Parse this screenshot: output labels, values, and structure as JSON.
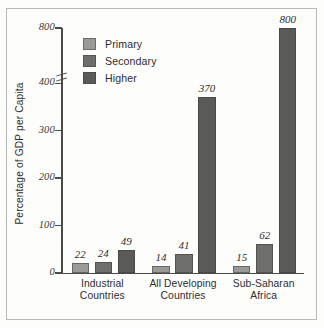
{
  "chart_data": {
    "type": "bar",
    "title": "",
    "subtitle": "",
    "xlabel": "",
    "ylabel": "Percentage of GDP per Capita",
    "categories": [
      "Industrial Countries",
      "All Developing Countries",
      "Sub-Saharan Africa"
    ],
    "category_lines": [
      [
        "Industrial",
        "Countries"
      ],
      [
        "All Developing",
        "Countries"
      ],
      [
        "Sub-Saharan",
        "Africa"
      ]
    ],
    "series": [
      {
        "name": "Primary",
        "color": "#9a9a97",
        "values": [
          22,
          24,
          15
        ]
      },
      {
        "name": "Secondary",
        "color": "#6e6e6c",
        "values": [
          24,
          41,
          62
        ]
      },
      {
        "name": "Higher",
        "color": "#5a5a58",
        "values": [
          49,
          370,
          800
        ]
      }
    ],
    "bar_groups": [
      {
        "category": "Industrial Countries",
        "bars": [
          {
            "series": "Primary",
            "value": 22,
            "label": "22"
          },
          {
            "series": "Secondary",
            "value": 24,
            "label": "24"
          },
          {
            "series": "Higher",
            "value": 49,
            "label": "49"
          }
        ]
      },
      {
        "category": "All Developing Countries",
        "bars": [
          {
            "series": "Primary",
            "value": 14,
            "label": "14"
          },
          {
            "series": "Secondary",
            "value": 41,
            "label": "41"
          },
          {
            "series": "Higher",
            "value": 370,
            "label": "370"
          }
        ]
      },
      {
        "category": "Sub-Saharan Africa",
        "bars": [
          {
            "series": "Primary",
            "value": 15,
            "label": "15"
          },
          {
            "series": "Secondary",
            "value": 62,
            "label": "62"
          },
          {
            "series": "Higher",
            "value": 800,
            "label": "800"
          }
        ]
      }
    ],
    "yticks": [
      0,
      100,
      200,
      300,
      400,
      800
    ],
    "ytick_labels": [
      "0",
      "100",
      "200",
      "300",
      "400",
      "800"
    ],
    "ylim": [
      0,
      800
    ],
    "axis_break": {
      "present": true,
      "between": [
        400,
        800
      ]
    },
    "grid": false,
    "legend": {
      "position": "top-left-inside",
      "entries": [
        {
          "label": "Primary",
          "color": "#9a9a97"
        },
        {
          "label": "Secondary",
          "color": "#6e6e6c"
        },
        {
          "label": "Higher",
          "color": "#5a5a58"
        }
      ]
    },
    "colors": {
      "background": "#fdfdfb",
      "frame": "#b9b9b4",
      "axis": "#4a4a48",
      "text": "#2e2e2c"
    }
  }
}
